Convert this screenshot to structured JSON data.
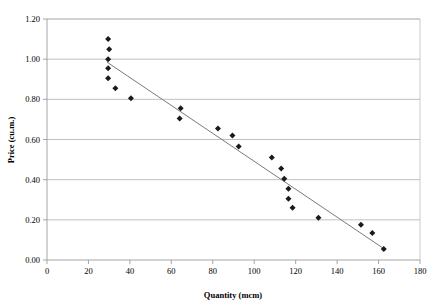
{
  "chart_data": {
    "type": "scatter",
    "title": "",
    "xlabel": "Quantity (mcm)",
    "ylabel": "Price (cu.m.)",
    "xlim": [
      0,
      180
    ],
    "ylim": [
      0.0,
      1.2
    ],
    "xticks": [
      "0",
      "20",
      "40",
      "60",
      "80",
      "100",
      "120",
      "140",
      "160",
      "180"
    ],
    "xtick_values": [
      0,
      20,
      40,
      60,
      80,
      100,
      120,
      140,
      160,
      180
    ],
    "yticks": [
      "0.00",
      "0.20",
      "0.40",
      "0.60",
      "0.80",
      "1.00",
      "1.20"
    ],
    "ytick_values": [
      0.0,
      0.2,
      0.4,
      0.6,
      0.8,
      1.0,
      1.2
    ],
    "grid": "horizontal",
    "legend": "none",
    "marker_shape": "diamond",
    "marker_color": "#1a1a1a",
    "trendline_color": "#7a7a7a",
    "series": [
      {
        "name": "Observations",
        "points": [
          [
            29.5,
            1.1
          ],
          [
            30.0,
            1.05
          ],
          [
            29.5,
            1.0
          ],
          [
            29.5,
            0.955
          ],
          [
            29.5,
            0.905
          ],
          [
            33.0,
            0.855
          ],
          [
            40.5,
            0.805
          ],
          [
            64.5,
            0.755
          ],
          [
            64.0,
            0.705
          ],
          [
            82.5,
            0.655
          ],
          [
            89.5,
            0.62
          ],
          [
            92.5,
            0.565
          ],
          [
            108.5,
            0.51
          ],
          [
            113.0,
            0.455
          ],
          [
            114.5,
            0.405
          ],
          [
            116.5,
            0.355
          ],
          [
            116.5,
            0.305
          ],
          [
            118.5,
            0.26
          ],
          [
            131.0,
            0.21
          ],
          [
            151.5,
            0.175
          ],
          [
            157.0,
            0.135
          ],
          [
            162.5,
            0.055
          ]
        ]
      }
    ],
    "trendline": {
      "name": "Linear trend",
      "x_start": 29.0,
      "y_start": 0.985,
      "x_end": 163.5,
      "y_end": 0.05
    }
  }
}
